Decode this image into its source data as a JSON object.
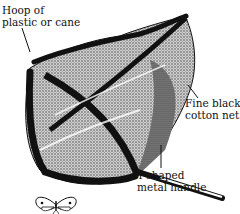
{
  "diagram": {
    "labels": [
      {
        "id": "hoop",
        "line1": "Hoop of",
        "line2": "plastic or cane"
      },
      {
        "id": "net",
        "line1": "Fine black",
        "line2": "cotton net"
      },
      {
        "id": "handle",
        "line1": "Y-shaped",
        "line2": "metal handle"
      }
    ],
    "colors": {
      "ink": "#111111",
      "paper": "#ffffff",
      "stipple": "#8a8a8a"
    }
  }
}
